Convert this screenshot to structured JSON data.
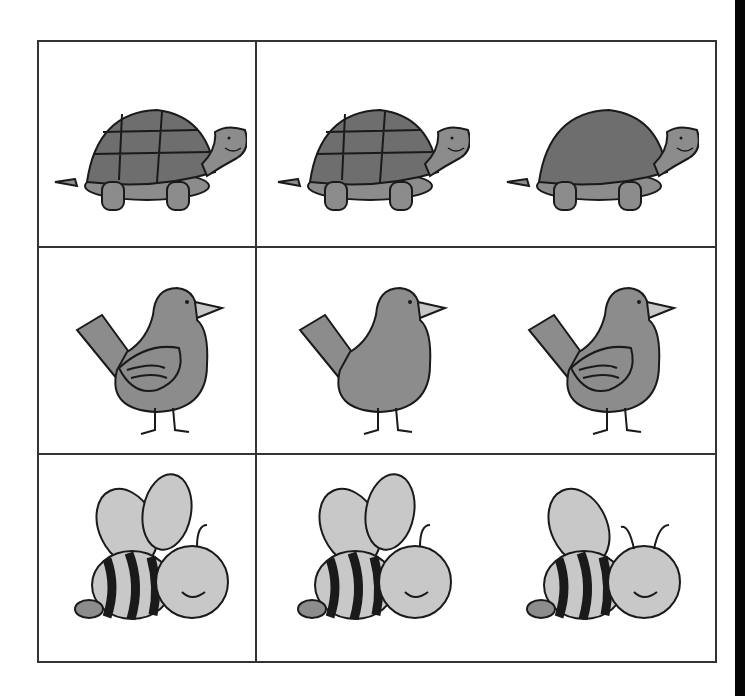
{
  "worksheet": {
    "layout": {
      "rows": 3,
      "columns": 3,
      "reference_column": 0
    },
    "colors": {
      "border": "#333333",
      "fill_dark": "#6e6e6e",
      "fill_mid": "#8c8c8c",
      "fill_light": "#c8c8c8",
      "outline": "#1a1a1a",
      "edge_bar": "#050505"
    },
    "rows": [
      {
        "animal": "turtle",
        "cells": [
          {
            "label": "turtle-reference",
            "variant": "shell-with-lines"
          },
          {
            "label": "turtle-option-1",
            "variant": "shell-with-lines"
          },
          {
            "label": "turtle-option-2",
            "variant": "shell-no-lines"
          }
        ]
      },
      {
        "animal": "bird",
        "cells": [
          {
            "label": "bird-reference",
            "variant": "with-wing"
          },
          {
            "label": "bird-option-1",
            "variant": "no-wing"
          },
          {
            "label": "bird-option-2",
            "variant": "with-wing"
          }
        ]
      },
      {
        "animal": "bee",
        "cells": [
          {
            "label": "bee-reference",
            "variant": "two-wings-one-antenna"
          },
          {
            "label": "bee-option-1",
            "variant": "two-wings-one-antenna"
          },
          {
            "label": "bee-option-2",
            "variant": "one-wing-two-antennae"
          }
        ]
      }
    ]
  }
}
